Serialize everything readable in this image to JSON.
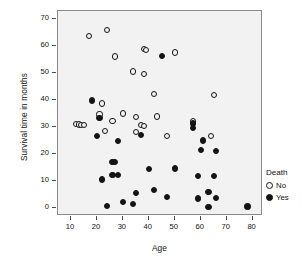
{
  "chart_data": {
    "type": "scatter",
    "title": "",
    "xlabel": "Age",
    "ylabel": "Survival time in months",
    "xlim": [
      5,
      84
    ],
    "ylim": [
      -3,
      73
    ],
    "xticks": [
      10,
      20,
      30,
      40,
      50,
      60,
      70,
      80
    ],
    "yticks": [
      0,
      10,
      20,
      30,
      40,
      50,
      60,
      70
    ],
    "grid": false,
    "panel_background": "#f2f2f2",
    "legend": {
      "title": "Death",
      "position": "right",
      "entries": [
        {
          "label": "No",
          "marker": "open-circle",
          "color": "#141414"
        },
        {
          "label": "Yes",
          "marker": "filled-circle",
          "color": "#141414"
        }
      ]
    },
    "series": [
      {
        "name": "No",
        "marker": "open-circle",
        "points": [
          [
            17,
            63.7
          ],
          [
            24,
            66.1
          ],
          [
            27,
            56.1
          ],
          [
            38,
            58.9
          ],
          [
            39,
            58.6
          ],
          [
            50,
            57.6
          ],
          [
            34,
            50.6
          ],
          [
            38,
            49.6
          ],
          [
            42,
            42.3
          ],
          [
            65,
            41.9
          ],
          [
            22,
            38.7
          ],
          [
            21,
            34.6
          ],
          [
            30,
            35.0
          ],
          [
            35,
            33.7
          ],
          [
            43,
            33.9
          ],
          [
            26,
            32.1
          ],
          [
            57,
            32.3
          ],
          [
            23,
            28.5
          ],
          [
            12,
            31.1
          ],
          [
            13,
            30.9
          ],
          [
            14,
            30.6
          ],
          [
            15,
            30.6
          ],
          [
            37,
            30.6
          ],
          [
            38,
            30.3
          ],
          [
            35,
            28.1
          ],
          [
            47,
            26.6
          ],
          [
            64,
            26.8
          ]
        ]
      },
      {
        "name": "Yes",
        "marker": "filled-circle",
        "points": [
          [
            45,
            56.4
          ],
          [
            18,
            39.8
          ],
          [
            21,
            33.3
          ],
          [
            57,
            29.6
          ],
          [
            57,
            31.3
          ],
          [
            20,
            26.7
          ],
          [
            37,
            27.1
          ],
          [
            28,
            24.8
          ],
          [
            61,
            25.0
          ],
          [
            60,
            21.4
          ],
          [
            66,
            21.1
          ],
          [
            26,
            17.0
          ],
          [
            27,
            16.9
          ],
          [
            26,
            12.3
          ],
          [
            28,
            12.1
          ],
          [
            40,
            14.3
          ],
          [
            50,
            14.6
          ],
          [
            59,
            11.7
          ],
          [
            65,
            11.9
          ],
          [
            22,
            10.5
          ],
          [
            42,
            6.5
          ],
          [
            35,
            5.6
          ],
          [
            63,
            6.0
          ],
          [
            47,
            4.0
          ],
          [
            59,
            3.5
          ],
          [
            66,
            3.6
          ],
          [
            30,
            2.3
          ],
          [
            34,
            1.3
          ],
          [
            24,
            0.7
          ],
          [
            63,
            0.4
          ],
          [
            78,
            0.5
          ]
        ]
      }
    ]
  },
  "axes": {
    "y_title": "Survival time in months",
    "x_title": "Age",
    "y_tick_labels": [
      "0",
      "10",
      "20",
      "30",
      "40",
      "50",
      "60",
      "70"
    ],
    "x_tick_labels": [
      "10",
      "20",
      "30",
      "40",
      "50",
      "60",
      "70",
      "80"
    ]
  },
  "legend": {
    "title": "Death",
    "no_label": "No",
    "yes_label": "Yes"
  }
}
